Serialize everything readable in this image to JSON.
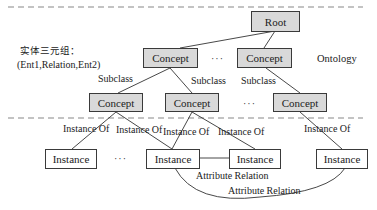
{
  "diagram": {
    "left_caption": {
      "line1": "实体三元组：",
      "line2": "(Ent1,Relation,Ent2)"
    },
    "ontology_label": "Ontology",
    "ellipsis": "···",
    "nodes": {
      "root": "Root",
      "level1": [
        "Concept",
        "Concept"
      ],
      "level2": [
        "Concept",
        "Concept",
        "Concept"
      ],
      "instances": [
        "Instance",
        "Instance",
        "Instance",
        "Instance"
      ]
    },
    "edge_labels": {
      "subclass": [
        "Subclass",
        "Subclass",
        "Subclass"
      ],
      "instance_of": [
        "Instance Of",
        "Instance Of",
        "Instance Of",
        "Instance Of",
        "Instance Of"
      ],
      "attribute_relation": [
        "Attribute Relation",
        "Attribute Relation"
      ]
    },
    "colors": {
      "concept_fill": "#d9d9d9",
      "instance_fill": "#ffffff",
      "border": "#3a3a3a",
      "dashed_line": "#888888"
    }
  }
}
